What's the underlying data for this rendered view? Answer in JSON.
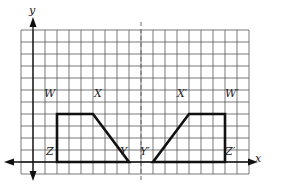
{
  "diagram": {
    "title": "",
    "axes": {
      "x_label": "x",
      "y_label": "y"
    },
    "grid": {
      "cols": 19,
      "rows": 12,
      "y_axis_col": 1,
      "x_axis_row": 1,
      "mirror_col": 10
    },
    "figures": [
      {
        "name": "WXYZ",
        "vertices": [
          {
            "label": "W",
            "col": 3,
            "row": 5
          },
          {
            "label": "X",
            "col": 6,
            "row": 5
          },
          {
            "label": "Y",
            "col": 9,
            "row": 1
          },
          {
            "label": "Z",
            "col": 3,
            "row": 1
          }
        ]
      },
      {
        "name": "W'X'Y'Z'",
        "vertices": [
          {
            "label": "W'",
            "col": 17,
            "row": 5
          },
          {
            "label": "X'",
            "col": 14,
            "row": 5
          },
          {
            "label": "Y'",
            "col": 11,
            "row": 1
          },
          {
            "label": "Z'",
            "col": 17,
            "row": 1
          }
        ]
      }
    ],
    "labels": {
      "W": "W",
      "X": "X",
      "Y": "Y",
      "Z": "Z",
      "W2": "W′",
      "X2": "X′",
      "Y2": "Y′",
      "Z2": "Z′"
    }
  }
}
